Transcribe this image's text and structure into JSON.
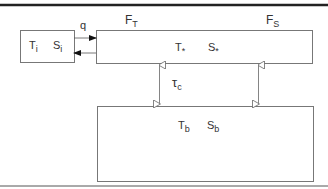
{
  "diagram": {
    "type": "ocean box model",
    "boxes": {
      "ice": {
        "t": "T",
        "t_sub": "i",
        "s": "S",
        "s_sub": "i"
      },
      "surface": {
        "t": "T",
        "t_sub": "*",
        "s": "S",
        "s_sub": "*"
      },
      "bottom": {
        "t": "T",
        "t_sub": "b",
        "s": "S",
        "s_sub": "b"
      }
    },
    "fluxes": {
      "q": "q",
      "ft": "F",
      "ft_sub": "T",
      "fs": "F",
      "fs_sub": "S",
      "tau": "τ",
      "tau_sub": "c"
    },
    "colors": {
      "line": "#555555",
      "rule": "#222222",
      "arrow": "#777777"
    }
  }
}
